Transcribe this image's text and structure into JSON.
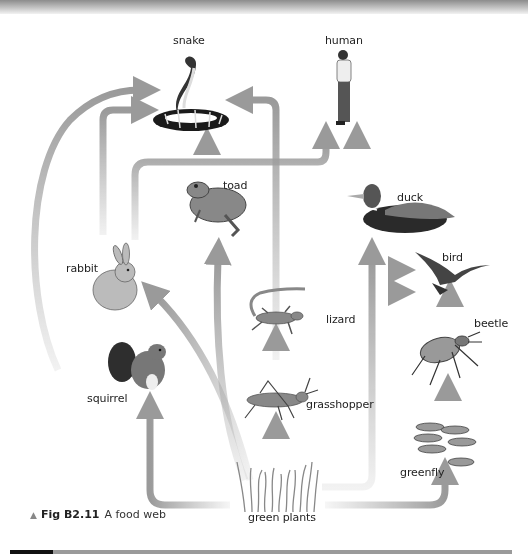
{
  "figure": {
    "number": "Fig B2.11",
    "caption": "A food web",
    "marker_icon": "triangle-up-icon"
  },
  "organisms": {
    "snake": "snake",
    "human": "human",
    "toad": "toad",
    "duck": "duck",
    "rabbit": "rabbit",
    "bird": "bird",
    "lizard": "lizard",
    "beetle": "beetle",
    "squirrel": "squirrel",
    "grasshopper": "grasshopper",
    "greenfly": "greenfly",
    "green_plants": "green plants"
  },
  "feeding_links": [
    {
      "from": "green plants",
      "to": "rabbit"
    },
    {
      "from": "green plants",
      "to": "squirrel"
    },
    {
      "from": "green plants",
      "to": "grasshopper"
    },
    {
      "from": "green plants",
      "to": "toad"
    },
    {
      "from": "green plants",
      "to": "duck"
    },
    {
      "from": "green plants",
      "to": "greenfly"
    },
    {
      "from": "green plants",
      "to": "human"
    },
    {
      "from": "grasshopper",
      "to": "lizard"
    },
    {
      "from": "grasshopper",
      "to": "snake"
    },
    {
      "from": "greenfly",
      "to": "beetle"
    },
    {
      "from": "beetle",
      "to": "bird"
    },
    {
      "from": "lizard",
      "to": "bird"
    },
    {
      "from": "rabbit",
      "to": "bird"
    },
    {
      "from": "rabbit",
      "to": "snake"
    },
    {
      "from": "rabbit",
      "to": "human"
    },
    {
      "from": "squirrel",
      "to": "snake"
    },
    {
      "from": "toad",
      "to": "snake"
    },
    {
      "from": "duck",
      "to": "human"
    }
  ],
  "colors": {
    "arrow": "#9a9a9a",
    "text": "#222222",
    "background": "#ffffff"
  }
}
